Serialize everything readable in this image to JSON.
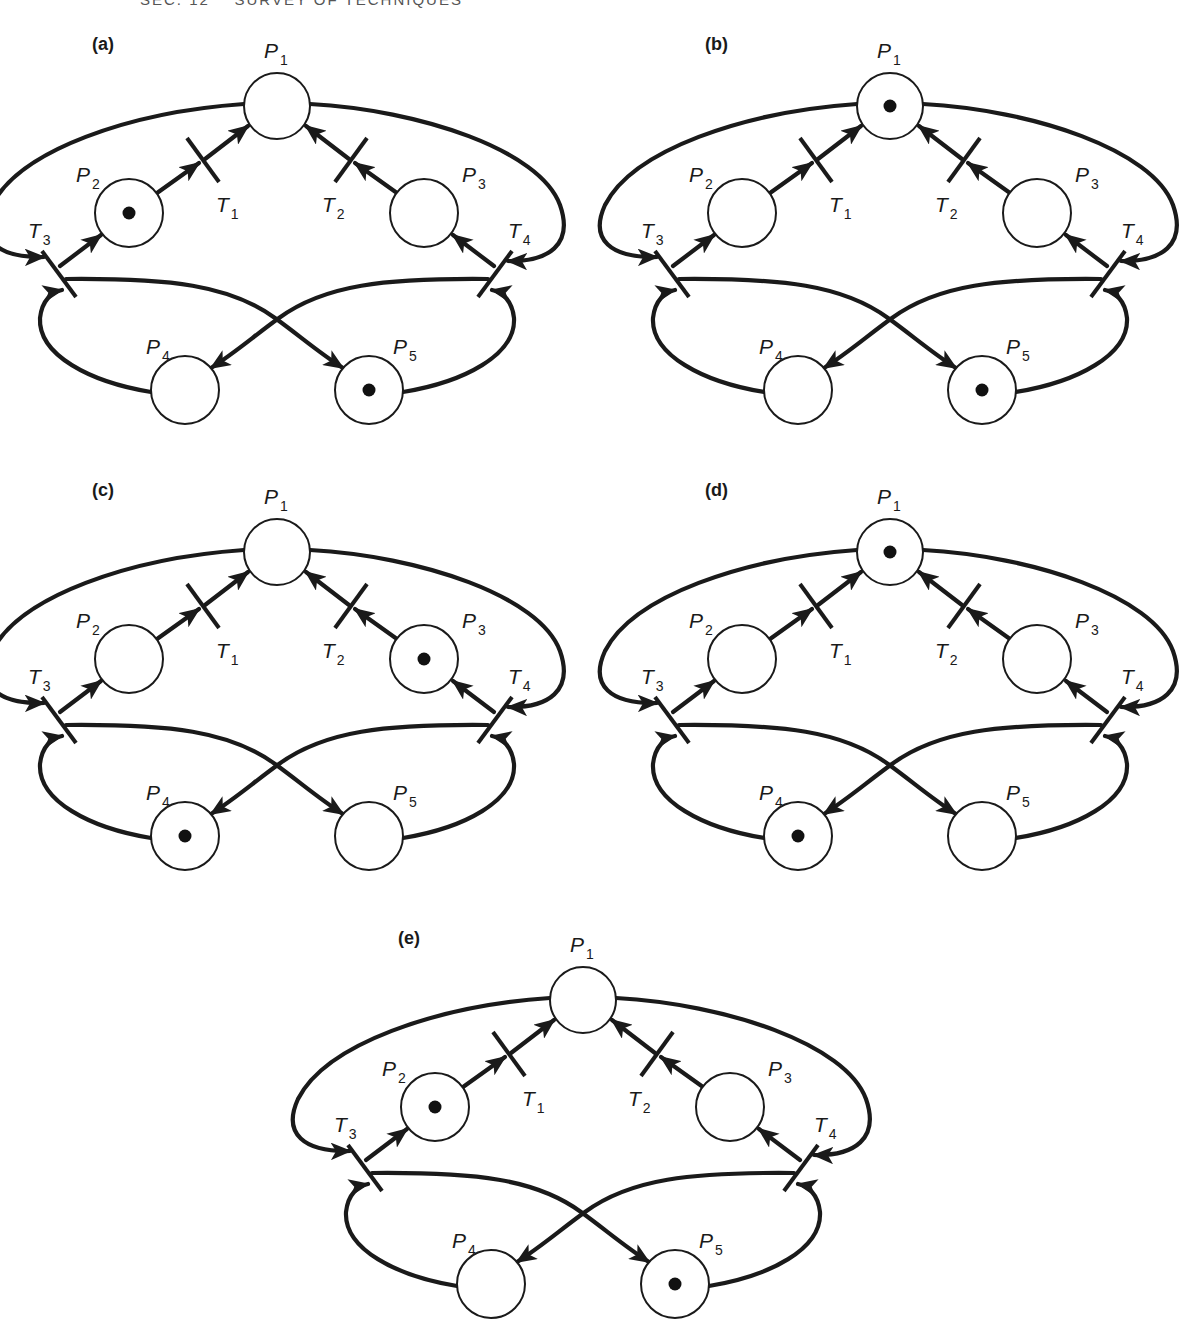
{
  "page": {
    "header": "SEC. 12    SURVEY OF TECHNIQUES"
  },
  "diagram": {
    "type": "petri-net",
    "places": [
      "P1",
      "P2",
      "P3",
      "P4",
      "P5"
    ],
    "transitions": [
      "T1",
      "T2",
      "T3",
      "T4"
    ],
    "arcs": [
      {
        "from": "P2",
        "to": "T1"
      },
      {
        "from": "T1",
        "to": "P1"
      },
      {
        "from": "P3",
        "to": "T2"
      },
      {
        "from": "T2",
        "to": "P1"
      },
      {
        "from": "P1",
        "to": "T3"
      },
      {
        "from": "T3",
        "to": "P2"
      },
      {
        "from": "P1",
        "to": "T4"
      },
      {
        "from": "T4",
        "to": "P3"
      },
      {
        "from": "P4",
        "to": "T3"
      },
      {
        "from": "T3",
        "to": "P5"
      },
      {
        "from": "P5",
        "to": "T4"
      },
      {
        "from": "T4",
        "to": "P4"
      }
    ],
    "panels": [
      {
        "id": "a",
        "label": "(a)",
        "dx": 0,
        "dy": 0,
        "tokens": [
          "P2",
          "P5"
        ]
      },
      {
        "id": "b",
        "label": "(b)",
        "dx": 613,
        "dy": 0,
        "tokens": [
          "P1",
          "P5"
        ]
      },
      {
        "id": "c",
        "label": "(c)",
        "dx": 0,
        "dy": 446,
        "tokens": [
          "P3",
          "P4"
        ]
      },
      {
        "id": "d",
        "label": "(d)",
        "dx": 613,
        "dy": 446,
        "tokens": [
          "P1",
          "P4"
        ]
      },
      {
        "id": "e",
        "label": "(e)",
        "dx": 306,
        "dy": 894,
        "tokens": [
          "P2",
          "P5"
        ]
      }
    ],
    "labels": {
      "P1": {
        "main": "P",
        "sub": "1"
      },
      "P2": {
        "main": "P",
        "sub": "2"
      },
      "P3": {
        "main": "P",
        "sub": "3"
      },
      "P4": {
        "main": "P",
        "sub": "4"
      },
      "P5": {
        "main": "P",
        "sub": "5"
      },
      "T1": {
        "main": "T",
        "sub": "1"
      },
      "T2": {
        "main": "T",
        "sub": "2"
      },
      "T3": {
        "main": "T",
        "sub": "3"
      },
      "T4": {
        "main": "T",
        "sub": "4"
      }
    }
  }
}
